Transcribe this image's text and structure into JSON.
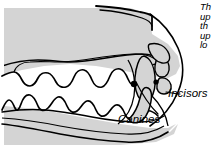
{
  "figure": {
    "fill_color": "#d4d4d4",
    "stroke_color": "#000000",
    "background_color": "#ffffff"
  },
  "labels": {
    "incisors": "Incisors",
    "canines": "Canines"
  },
  "caption": {
    "lines": [
      "Th",
      "up",
      "th",
      "up",
      "lo"
    ]
  }
}
